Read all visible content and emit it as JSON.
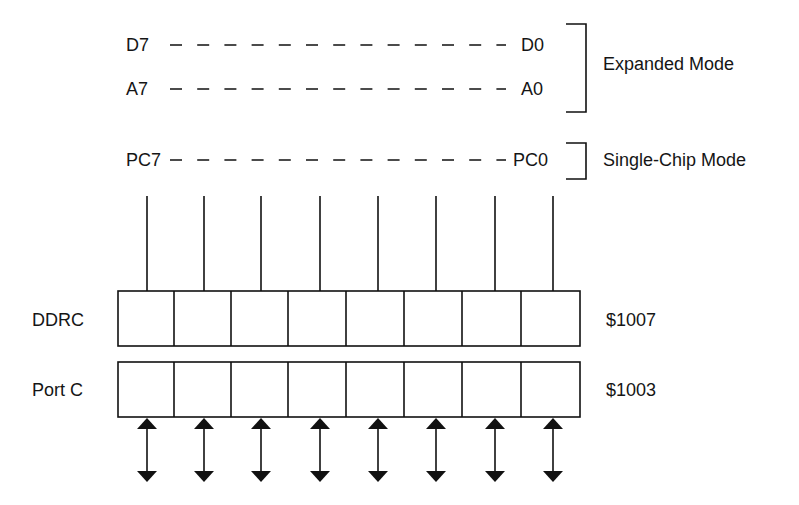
{
  "diagram": {
    "title_rows": {
      "expanded_mode": {
        "data_bus": {
          "left": "D7",
          "right": "D0"
        },
        "address_bus": {
          "left": "A7",
          "right": "A0"
        },
        "label": "Expanded Mode"
      },
      "single_chip_mode": {
        "port_pins": {
          "left": "PC7",
          "right": "PC0"
        },
        "label": "Single-Chip Mode"
      }
    },
    "registers": [
      {
        "name": "DDRC",
        "address": "$1007",
        "bits": 8
      },
      {
        "name": "Port C",
        "address": "$1003",
        "bits": 8
      }
    ],
    "bit_lines": 8,
    "io_arrows": {
      "count": 8,
      "direction": "bidirectional"
    },
    "colors": {
      "stroke": "#111111",
      "background": "#ffffff"
    }
  }
}
